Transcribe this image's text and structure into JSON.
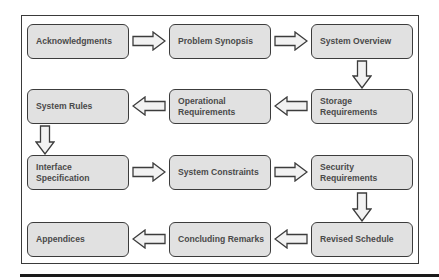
{
  "diagram": {
    "type": "flowchart",
    "layout": "serpentine 3-column grid",
    "colors": {
      "box_fill": "#e1e1e1",
      "box_border": "#3c3c3c",
      "text": "#4a4a4a",
      "arrow_fill": "#f2f2f2",
      "arrow_stroke": "#3c3c3c",
      "frame": "#3a3a3a",
      "rule": "#1a1a1a"
    },
    "nodes": [
      {
        "id": "n1",
        "label": "Acknowledgments",
        "row": 1,
        "col": 1
      },
      {
        "id": "n2",
        "label": "Problem Synopsis",
        "row": 1,
        "col": 2
      },
      {
        "id": "n3",
        "label": "System Overview",
        "row": 1,
        "col": 3
      },
      {
        "id": "n4",
        "label": "Storage\nRequirements",
        "row": 2,
        "col": 3
      },
      {
        "id": "n5",
        "label": "Operational\nRequirements",
        "row": 2,
        "col": 2
      },
      {
        "id": "n6",
        "label": "System Rules",
        "row": 2,
        "col": 1
      },
      {
        "id": "n7",
        "label": "Interface\nSpecification",
        "row": 3,
        "col": 1
      },
      {
        "id": "n8",
        "label": "System Constraints",
        "row": 3,
        "col": 2
      },
      {
        "id": "n9",
        "label": "Security\nRequirements",
        "row": 3,
        "col": 3
      },
      {
        "id": "n10",
        "label": "Revised Schedule",
        "row": 4,
        "col": 3
      },
      {
        "id": "n11",
        "label": "Concluding Remarks",
        "row": 4,
        "col": 2
      },
      {
        "id": "n12",
        "label": "Appendices",
        "row": 4,
        "col": 1
      }
    ],
    "edges": [
      {
        "from": "n1",
        "to": "n2",
        "direction": "right"
      },
      {
        "from": "n2",
        "to": "n3",
        "direction": "right"
      },
      {
        "from": "n3",
        "to": "n4",
        "direction": "down"
      },
      {
        "from": "n4",
        "to": "n5",
        "direction": "left"
      },
      {
        "from": "n5",
        "to": "n6",
        "direction": "left"
      },
      {
        "from": "n6",
        "to": "n7",
        "direction": "down"
      },
      {
        "from": "n7",
        "to": "n8",
        "direction": "right"
      },
      {
        "from": "n8",
        "to": "n9",
        "direction": "right"
      },
      {
        "from": "n9",
        "to": "n10",
        "direction": "down"
      },
      {
        "from": "n10",
        "to": "n11",
        "direction": "left"
      },
      {
        "from": "n11",
        "to": "n12",
        "direction": "left"
      }
    ]
  }
}
